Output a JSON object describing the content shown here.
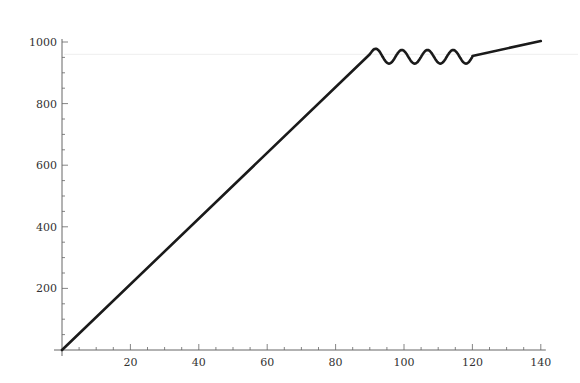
{
  "chart_data": {
    "type": "line",
    "title": "",
    "xlabel": "",
    "ylabel": "",
    "xlim": [
      0,
      140
    ],
    "ylim": [
      0,
      1000
    ],
    "grid": false,
    "legend": null,
    "x_ticks_major": [
      20,
      40,
      60,
      80,
      100,
      120,
      140
    ],
    "x_ticks_minor_step": 5,
    "y_ticks_major": [
      200,
      400,
      600,
      800,
      1000
    ],
    "y_ticks_minor_step": 50,
    "x_tick_labels": [
      "20",
      "40",
      "60",
      "80",
      "100",
      "120",
      "140"
    ],
    "y_tick_labels": [
      "200",
      "400",
      "600",
      "800",
      "1000"
    ],
    "reference_line_y": 960,
    "series": [
      {
        "name": "series-1",
        "color": "#1a1a1a",
        "segments": [
          {
            "kind": "linear",
            "x": [
              0,
              90
            ],
            "y": [
              0,
              960
            ]
          },
          {
            "kind": "oscillation",
            "x_start": 90,
            "x_end": 120,
            "center": 952,
            "amplitude": 22,
            "cycles": 4
          },
          {
            "kind": "linear",
            "x": [
              120,
              140
            ],
            "y": [
              955,
              1003
            ]
          }
        ],
        "points": [
          [
            0,
            0
          ],
          [
            20,
            213
          ],
          [
            40,
            427
          ],
          [
            60,
            640
          ],
          [
            80,
            853
          ],
          [
            90,
            960
          ],
          [
            91.5,
            974
          ],
          [
            95,
            929
          ],
          [
            99,
            974
          ],
          [
            102.5,
            929
          ],
          [
            106.5,
            974
          ],
          [
            110,
            929
          ],
          [
            114,
            974
          ],
          [
            118,
            929
          ],
          [
            120,
            955
          ],
          [
            140,
            1003
          ]
        ]
      }
    ]
  },
  "plot_area": {
    "x0_px": 62,
    "y0_px": 350,
    "px_per_x": 3.42,
    "px_per_y": 0.308
  }
}
